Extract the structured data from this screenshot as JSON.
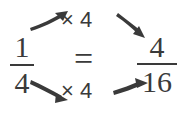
{
  "diagram": {
    "ink_color": "#3a3a3a",
    "background_color": "#ffffff",
    "left_fraction": {
      "numerator": "1",
      "denominator": "4"
    },
    "right_fraction": {
      "numerator": "4",
      "denominator": "16"
    },
    "relation": "=",
    "operations": {
      "top_label": "× 4",
      "bottom_label": "× 4"
    },
    "arrows": {
      "top_left": "arrow-up-right-icon",
      "top_right": "arrow-down-right-icon",
      "bottom_left": "arrow-down-right-icon",
      "bottom_right": "arrow-up-right-icon"
    }
  }
}
